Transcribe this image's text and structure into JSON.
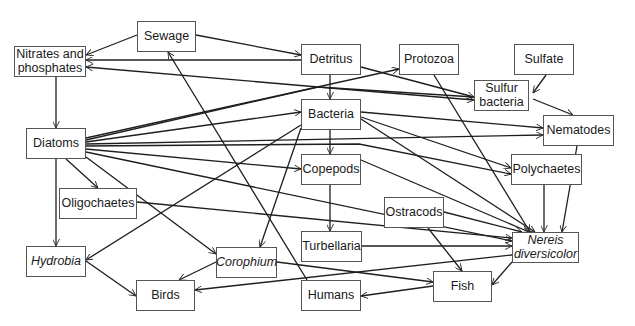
{
  "diagram": {
    "title": "",
    "nodes": [
      {
        "id": "sewage",
        "label": "Sewage",
        "italic": false,
        "x": 137,
        "y": 21,
        "w": 59,
        "h": 31
      },
      {
        "id": "nitrates",
        "label": "Nitrates and\nphosphates",
        "italic": false,
        "x": 14,
        "y": 46,
        "w": 72,
        "h": 31
      },
      {
        "id": "detritus",
        "label": "Detritus",
        "italic": false,
        "x": 301,
        "y": 44,
        "w": 60,
        "h": 31
      },
      {
        "id": "protozoa",
        "label": "Protozoa",
        "italic": false,
        "x": 399,
        "y": 44,
        "w": 60,
        "h": 31
      },
      {
        "id": "sulfate",
        "label": "Sulfate",
        "italic": false,
        "x": 514,
        "y": 44,
        "w": 60,
        "h": 31
      },
      {
        "id": "sulfur_bacteria",
        "label": "Sulfur\nbacteria",
        "italic": false,
        "x": 474,
        "y": 80,
        "w": 55,
        "h": 31
      },
      {
        "id": "bacteria",
        "label": "Bacteria",
        "italic": false,
        "x": 301,
        "y": 99,
        "w": 60,
        "h": 31
      },
      {
        "id": "nematodes",
        "label": "Nematodes",
        "italic": false,
        "x": 543,
        "y": 115,
        "w": 71,
        "h": 31
      },
      {
        "id": "diatoms",
        "label": "Diatoms",
        "italic": false,
        "x": 26,
        "y": 128,
        "w": 60,
        "h": 31
      },
      {
        "id": "copepods",
        "label": "Copepods",
        "italic": false,
        "x": 301,
        "y": 154,
        "w": 60,
        "h": 31
      },
      {
        "id": "polychaetes",
        "label": "Polychaetes",
        "italic": false,
        "x": 511,
        "y": 154,
        "w": 71,
        "h": 31
      },
      {
        "id": "oligochaetes",
        "label": "Oligochaetes",
        "italic": false,
        "x": 59,
        "y": 188,
        "w": 78,
        "h": 31
      },
      {
        "id": "ostracods",
        "label": "Ostracods",
        "italic": false,
        "x": 384,
        "y": 197,
        "w": 60,
        "h": 31
      },
      {
        "id": "hydrobia",
        "label": "Hydrobia",
        "italic": true,
        "x": 26,
        "y": 246,
        "w": 60,
        "h": 31
      },
      {
        "id": "corophium",
        "label": "Corophium",
        "italic": true,
        "x": 216,
        "y": 247,
        "w": 61,
        "h": 31
      },
      {
        "id": "turbellaria",
        "label": "Turbellaria",
        "italic": false,
        "x": 301,
        "y": 231,
        "w": 61,
        "h": 31
      },
      {
        "id": "nereis",
        "label": "Nereis\ndiversicolor",
        "italic": true,
        "x": 512,
        "y": 232,
        "w": 67,
        "h": 31
      },
      {
        "id": "birds",
        "label": "Birds",
        "italic": false,
        "x": 136,
        "y": 280,
        "w": 59,
        "h": 31
      },
      {
        "id": "humans",
        "label": "Humans",
        "italic": false,
        "x": 301,
        "y": 280,
        "w": 60,
        "h": 31
      },
      {
        "id": "fish",
        "label": "Fish",
        "italic": false,
        "x": 433,
        "y": 271,
        "w": 59,
        "h": 31
      }
    ],
    "edges": [
      {
        "from": "sewage",
        "to": "nitrates",
        "points": [
          [
            137,
            35
          ],
          [
            86,
            55
          ]
        ]
      },
      {
        "from": "sewage",
        "to": "detritus",
        "points": [
          [
            196,
            35
          ],
          [
            301,
            55
          ]
        ]
      },
      {
        "from": "detritus",
        "to": "nitrates",
        "points": [
          [
            301,
            60
          ],
          [
            86,
            60
          ]
        ]
      },
      {
        "from": "sulfur_bacteria",
        "to": "nitrates",
        "points": [
          [
            474,
            97
          ],
          [
            318,
            87
          ],
          [
            86,
            67
          ]
        ]
      },
      {
        "from": "detritus",
        "to": "sulfur_bacteria",
        "points": [
          [
            361,
            67
          ],
          [
            474,
            97
          ]
        ]
      },
      {
        "from": "detritus",
        "to": "bacteria",
        "points": [
          [
            330,
            75
          ],
          [
            330,
            99
          ]
        ]
      },
      {
        "from": "nitrates",
        "to": "diatoms",
        "points": [
          [
            56,
            77
          ],
          [
            56,
            128
          ]
        ]
      },
      {
        "from": "diatoms",
        "to": "protozoa",
        "points": [
          [
            86,
            138
          ],
          [
            399,
            69
          ]
        ]
      },
      {
        "from": "diatoms",
        "to": "sulfur_bacteria",
        "points": [
          [
            86,
            140
          ],
          [
            318,
            87
          ],
          [
            474,
            100
          ]
        ]
      },
      {
        "from": "diatoms",
        "to": "bacteria",
        "points": [
          [
            86,
            142
          ],
          [
            301,
            112
          ]
        ]
      },
      {
        "from": "diatoms",
        "to": "nematodes",
        "points": [
          [
            86,
            144
          ],
          [
            543,
            135
          ]
        ]
      },
      {
        "from": "diatoms",
        "to": "polychaetes",
        "points": [
          [
            86,
            146
          ],
          [
            359,
            144
          ],
          [
            511,
            174
          ]
        ]
      },
      {
        "from": "diatoms",
        "to": "copepods",
        "points": [
          [
            86,
            149
          ],
          [
            301,
            169
          ]
        ]
      },
      {
        "from": "diatoms",
        "to": "nereis",
        "points": [
          [
            86,
            152
          ],
          [
            512,
            241
          ]
        ]
      },
      {
        "from": "diatoms",
        "to": "oligochaetes",
        "points": [
          [
            66,
            159
          ],
          [
            98,
            188
          ]
        ]
      },
      {
        "from": "diatoms",
        "to": "corophium",
        "points": [
          [
            86,
            157
          ],
          [
            216,
            254
          ]
        ]
      },
      {
        "from": "diatoms",
        "to": "hydrobia",
        "points": [
          [
            56,
            159
          ],
          [
            56,
            246
          ]
        ]
      },
      {
        "from": "bacteria",
        "to": "nematodes",
        "points": [
          [
            361,
            112
          ],
          [
            543,
            128
          ]
        ]
      },
      {
        "from": "bacteria",
        "to": "polychaetes",
        "points": [
          [
            361,
            117
          ],
          [
            511,
            168
          ]
        ]
      },
      {
        "from": "bacteria",
        "to": "nereis",
        "points": [
          [
            361,
            119
          ],
          [
            535,
            232
          ]
        ]
      },
      {
        "from": "bacteria",
        "to": "copepods",
        "points": [
          [
            330,
            130
          ],
          [
            330,
            154
          ]
        ]
      },
      {
        "from": "bacteria",
        "to": "hydrobia",
        "points": [
          [
            301,
            125
          ],
          [
            86,
            260
          ]
        ]
      },
      {
        "from": "bacteria",
        "to": "corophium",
        "points": [
          [
            301,
            128
          ],
          [
            260,
            247
          ]
        ]
      },
      {
        "from": "protozoa",
        "to": "nereis",
        "points": [
          [
            434,
            75
          ],
          [
            530,
            232
          ]
        ]
      },
      {
        "from": "sulfate",
        "to": "sulfur_bacteria",
        "points": [
          [
            546,
            75
          ],
          [
            533,
            93
          ]
        ]
      },
      {
        "from": "sulfur_bacteria",
        "to": "nematodes",
        "points": [
          [
            533,
            99
          ],
          [
            573,
            115
          ]
        ]
      },
      {
        "from": "nematodes",
        "to": "nereis",
        "points": [
          [
            577,
            146
          ],
          [
            562,
            232
          ]
        ]
      },
      {
        "from": "polychaetes",
        "to": "nereis",
        "points": [
          [
            544,
            185
          ],
          [
            544,
            232
          ]
        ]
      },
      {
        "from": "copepods",
        "to": "turbellaria",
        "points": [
          [
            330,
            185
          ],
          [
            330,
            231
          ]
        ]
      },
      {
        "from": "copepods",
        "to": "nereis",
        "points": [
          [
            361,
            160
          ],
          [
            529,
            232
          ]
        ]
      },
      {
        "from": "oligochaetes",
        "to": "nereis",
        "points": [
          [
            137,
            202
          ],
          [
            512,
            238
          ]
        ]
      },
      {
        "from": "ostracods",
        "to": "nereis",
        "points": [
          [
            444,
            212
          ],
          [
            522,
            232
          ]
        ]
      },
      {
        "from": "ostracods",
        "to": "fish",
        "points": [
          [
            428,
            228
          ],
          [
            462,
            271
          ]
        ]
      },
      {
        "from": "turbellaria",
        "to": "nereis",
        "points": [
          [
            362,
            246
          ],
          [
            512,
            246
          ]
        ]
      },
      {
        "from": "nereis",
        "to": "fish",
        "points": [
          [
            512,
            262
          ],
          [
            492,
            285
          ]
        ]
      },
      {
        "from": "nereis",
        "to": "birds",
        "points": [
          [
            512,
            255
          ],
          [
            195,
            290
          ]
        ]
      },
      {
        "from": "corophium",
        "to": "birds",
        "points": [
          [
            216,
            262
          ],
          [
            179,
            280
          ]
        ]
      },
      {
        "from": "corophium",
        "to": "fish",
        "points": [
          [
            277,
            262
          ],
          [
            433,
            282
          ]
        ]
      },
      {
        "from": "hydrobia",
        "to": "birds",
        "points": [
          [
            86,
            261
          ],
          [
            136,
            296
          ]
        ]
      },
      {
        "from": "fish",
        "to": "humans",
        "points": [
          [
            433,
            286
          ],
          [
            361,
            296
          ]
        ]
      },
      {
        "from": "humans",
        "to": "sewage",
        "points": [
          [
            307,
            280
          ],
          [
            168,
            52
          ]
        ]
      }
    ]
  }
}
